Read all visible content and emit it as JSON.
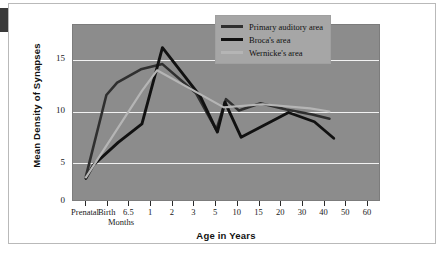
{
  "chart_data": {
    "type": "line",
    "title": "",
    "xlabel": "Age in Years",
    "ylabel": "Mean Density of Synapses",
    "x_sub_note": "Months",
    "categories": [
      "Prenatal",
      "Birth",
      "6.5",
      "1",
      "2",
      "3",
      "5",
      "10",
      "15",
      "20",
      "30",
      "40",
      "50",
      "60"
    ],
    "ylim": [
      0,
      17
    ],
    "yticks": [
      0,
      5,
      10,
      15
    ],
    "grid": true,
    "legend_position": "top-right",
    "series": [
      {
        "name": "Primary auditory area",
        "color": "#2f2f2f",
        "points": [
          {
            "x": 0.0,
            "y": 2.3
          },
          {
            "x": 0.95,
            "y": 10.2
          },
          {
            "x": 1.45,
            "y": 11.4
          },
          {
            "x": 2.55,
            "y": 12.7
          },
          {
            "x": 3.55,
            "y": 13.2
          },
          {
            "x": 5.1,
            "y": 10.4
          },
          {
            "x": 6.05,
            "y": 6.8
          },
          {
            "x": 6.5,
            "y": 9.8
          },
          {
            "x": 7.1,
            "y": 8.7
          },
          {
            "x": 8.1,
            "y": 9.4
          },
          {
            "x": 9.3,
            "y": 8.8
          },
          {
            "x": 10.5,
            "y": 8.3
          },
          {
            "x": 11.3,
            "y": 7.9
          }
        ]
      },
      {
        "name": "Broca's area",
        "color": "#111111",
        "points": [
          {
            "x": 0.0,
            "y": 2.1
          },
          {
            "x": 0.35,
            "y": 3.4
          },
          {
            "x": 1.5,
            "y": 5.6
          },
          {
            "x": 2.6,
            "y": 7.4
          },
          {
            "x": 3.55,
            "y": 14.8
          },
          {
            "x": 5.3,
            "y": 10.1
          },
          {
            "x": 6.1,
            "y": 6.6
          },
          {
            "x": 6.45,
            "y": 9.5
          },
          {
            "x": 7.2,
            "y": 6.1
          },
          {
            "x": 9.4,
            "y": 8.5
          },
          {
            "x": 10.6,
            "y": 7.6
          },
          {
            "x": 11.5,
            "y": 6.0
          }
        ]
      },
      {
        "name": "Wernicke's area",
        "color": "#b5b5b5",
        "points": [
          {
            "x": 0.0,
            "y": 2.2
          },
          {
            "x": 2.6,
            "y": 10.6
          },
          {
            "x": 3.3,
            "y": 12.6
          },
          {
            "x": 6.4,
            "y": 9.0
          },
          {
            "x": 8.2,
            "y": 9.3
          },
          {
            "x": 10.4,
            "y": 8.9
          },
          {
            "x": 11.3,
            "y": 8.6
          }
        ]
      }
    ]
  },
  "legend": {
    "items": [
      {
        "label": "Primary auditory area",
        "color": "#2f2f2f"
      },
      {
        "label": "Broca's area",
        "color": "#111111"
      },
      {
        "label": "Wernicke's area",
        "color": "#b5b5b5"
      }
    ]
  },
  "colors": {
    "plot_background": "#8c8c8c",
    "gridline": "#f2f2f2",
    "legend_background": "#a6a6a6",
    "page_background": "#ffffff"
  }
}
